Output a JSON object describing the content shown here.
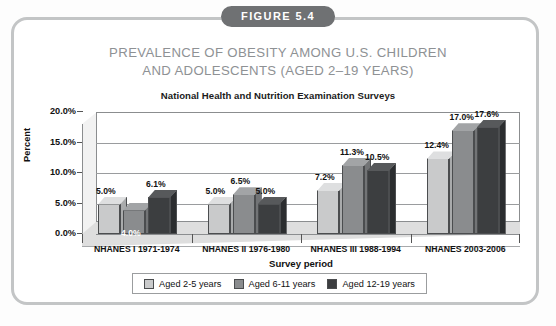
{
  "figure": {
    "badge": "FIGURE 5.4",
    "title_line1": "PREVALENCE OF OBESITY AMONG U.S. CHILDREN",
    "title_line2": "AND ADOLESCENTS (AGED 2–19 YEARS)",
    "badge_color": "#6f7173",
    "title_color": "#8e9194",
    "frame_color": "#c3c5c6"
  },
  "chart_data": {
    "type": "bar",
    "title": "National Health and Nutrition Examination Surveys",
    "xlabel": "Survey period",
    "ylabel": "Percent",
    "categories": [
      "NHANES I 1971-1974",
      "NHANES II 1976-1980",
      "NHANES III 1988-1994",
      "NHANES 2003-2006"
    ],
    "series": [
      {
        "name": "Aged 2-5 years",
        "color": "#c9cacb",
        "values": [
          5.0,
          5.0,
          7.2,
          12.4
        ],
        "labels": [
          "5.0%",
          "5.0%",
          "7.2%",
          "12.4%"
        ]
      },
      {
        "name": "Aged 6-11 years",
        "color": "#8a8c8e",
        "values": [
          4.0,
          6.5,
          11.3,
          17.0
        ],
        "labels": [
          "4.0%",
          "6.5%",
          "11.3%",
          "17.0%"
        ]
      },
      {
        "name": "Aged 12-19 years",
        "color": "#3c3e40",
        "values": [
          6.1,
          5.0,
          10.5,
          17.6
        ],
        "labels": [
          "6.1%",
          "5.0%",
          "10.5%",
          "17.6%"
        ]
      }
    ],
    "ylim": [
      0,
      20
    ],
    "yticks": [
      0.0,
      5.0,
      10.0,
      15.0,
      20.0
    ],
    "ytick_labels": [
      "0.0%",
      "5.0%",
      "10.0%",
      "15.0%",
      "20.0%"
    ],
    "grid": true,
    "legend_position": "bottom",
    "style": "3d-clustered-column"
  }
}
